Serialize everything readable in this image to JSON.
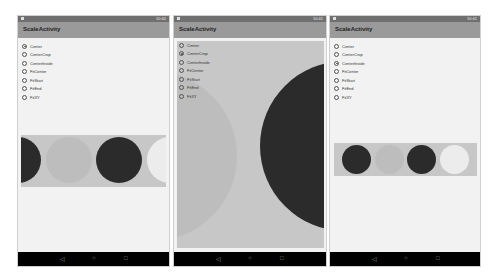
{
  "app": {
    "title": "ScaleActivity"
  },
  "radio_options": [
    "Center",
    "CenterCrop",
    "CenterInside",
    "FitCenter",
    "FitStart",
    "FitEnd",
    "FitXY"
  ],
  "screens": [
    {
      "selected": "Center",
      "status_time": "10:40"
    },
    {
      "selected": "CenterCrop",
      "status_time": "10:41"
    },
    {
      "selected": "CenterInside",
      "status_time": "10:41"
    }
  ],
  "navbar": {
    "back_icon": "◁",
    "home_icon": "○",
    "recents_icon": "□"
  },
  "colors": {
    "dark_circle": "#2b2b2b",
    "mid_circle": "#bdbdbd",
    "light_circle": "#ececec",
    "image_bg": "#c7c7c7",
    "toolbar": "#9a9a9a"
  }
}
